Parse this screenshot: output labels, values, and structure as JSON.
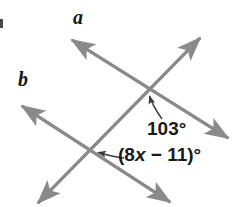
{
  "figure": {
    "type": "geometry-diagram",
    "background_color": "#ffffff",
    "line_color": "#8a8a8a",
    "text_color": "#1a1a1a",
    "labels": {
      "line_a": "a",
      "line_b": "b",
      "angle_known": "103°",
      "angle_expression_prefix": "(8",
      "angle_expression_variable": "x",
      "angle_expression_suffix": " − 11)°"
    },
    "lines": [
      {
        "name": "line-a",
        "label": "a",
        "from": [
          72,
          40
        ],
        "to": [
          228,
          138
        ],
        "arrows": "both"
      },
      {
        "name": "line-b",
        "label": "b",
        "from": [
          22,
          106
        ],
        "to": [
          170,
          202
        ],
        "arrows": "both"
      },
      {
        "name": "transversal",
        "label": "",
        "from": [
          38,
          203
        ],
        "to": [
          200,
          38
        ],
        "arrows": "both"
      }
    ],
    "intersections": [
      {
        "name": "upper-intersection",
        "point": [
          145,
          88
        ]
      },
      {
        "name": "lower-intersection",
        "point": [
          88,
          150
        ]
      }
    ],
    "leaders": [
      {
        "name": "leader-angle-known",
        "target": [
          148,
          93
        ],
        "from": [
          162,
          119
        ]
      },
      {
        "name": "leader-angle-expression",
        "target": [
          94,
          152
        ],
        "from": [
          122,
          157
        ]
      }
    ]
  }
}
